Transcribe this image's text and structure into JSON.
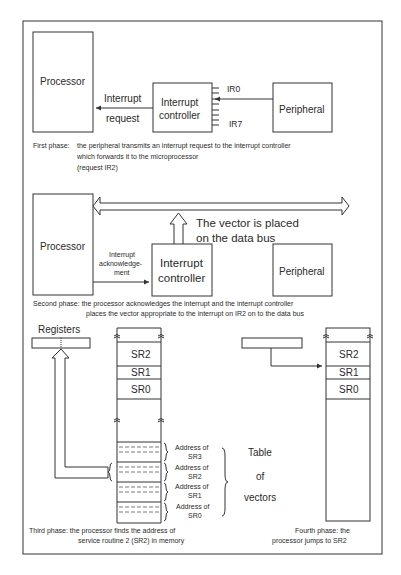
{
  "figure": {
    "phase1": {
      "processor_label": "Processor",
      "controller_label_line1": "Interrupt",
      "controller_label_line2": "controller",
      "peripheral_label": "Peripheral",
      "arrow_label_line1": "Interrupt",
      "arrow_label_line2": "request",
      "ir_top": "IR0",
      "ir_bottom": "IR7",
      "caption_head": "First phase:",
      "caption_line1": "the peripheral transmits an interrupt request to the interrupt controller",
      "caption_line2": "which forwards it to the microprocessor",
      "caption_line3": "(request IR2)"
    },
    "phase2": {
      "processor_label": "Processor",
      "controller_label_line1": "Interrupt",
      "controller_label_line2": "controller",
      "peripheral_label": "Peripheral",
      "ack_label_line1": "Interrupt",
      "ack_label_line2": "acknowledge-",
      "ack_label_line3": "ment",
      "bus_note_line1": "The vector is placed",
      "bus_note_line2": "on the data bus",
      "caption_line1": "Second phase: the processor acknowledges the interrupt and the interrupt controller",
      "caption_line2": "places the vector appropriate to the interrupt on IR2 on to the data bus"
    },
    "phase3": {
      "registers_label": "Registers",
      "memory_cells": [
        "SR2",
        "SR1",
        "SR0"
      ],
      "vector_entries": [
        {
          "line1": "Address of",
          "line2": "SR3"
        },
        {
          "line1": "Address of",
          "line2": "SR2"
        },
        {
          "line1": "Address of",
          "line2": "SR1"
        },
        {
          "line1": "Address of",
          "line2": "SR0"
        }
      ],
      "table_label_line1": "Table",
      "table_label_line2": "of",
      "table_label_line3": "vectors",
      "caption_line1": "Third phase: the processor finds the address of",
      "caption_line2": "service routine 2 (SR2) in memory"
    },
    "phase4": {
      "memory_cells": [
        "SR2",
        "SR1",
        "SR0"
      ],
      "caption_line1": "Fourth phase: the",
      "caption_line2": "processor jumps to SR2"
    }
  }
}
